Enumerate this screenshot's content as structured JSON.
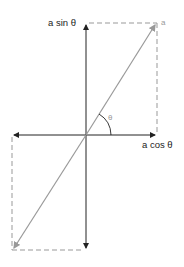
{
  "diagram": {
    "labels": {
      "y_component": "a sin θ",
      "x_component": "a cos θ",
      "angle": "θ",
      "vector": "a"
    },
    "colors": {
      "axis": "#222222",
      "vector": "#999999",
      "dashed": "#999999"
    }
  }
}
